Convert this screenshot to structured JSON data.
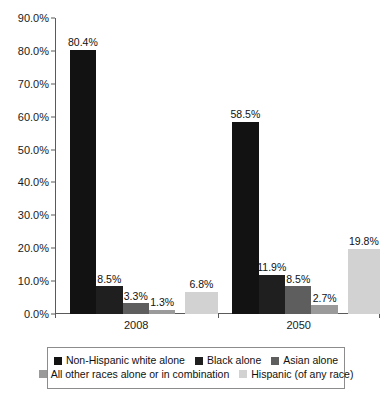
{
  "chart_data": {
    "type": "bar",
    "title": "",
    "subtitle": "",
    "xlabel": "",
    "ylabel": "",
    "grid": false,
    "legend_position": "bottom",
    "ylim": [
      0,
      90
    ],
    "ytick_labels": [
      "90.0%",
      "80.0%",
      "70.0%",
      "60.0%",
      "50.0%",
      "40.0%",
      "30.0%",
      "20.0%",
      "10.0%",
      "0.0%"
    ],
    "ytick_values": [
      90,
      80,
      70,
      60,
      50,
      40,
      30,
      20,
      10,
      0
    ],
    "categories": [
      "2008",
      "2050"
    ],
    "series": [
      {
        "name": "Non-Hispanic white alone",
        "color": "#121212",
        "values": [
          80.4,
          58.5
        ],
        "labels": [
          "80.4%",
          "58.5%"
        ]
      },
      {
        "name": "Black alone",
        "color": "#1f1f1f",
        "values": [
          8.5,
          11.9
        ],
        "labels": [
          "8.5%",
          "11.9%"
        ]
      },
      {
        "name": "Asian alone",
        "color": "#5e5e5e",
        "values": [
          3.3,
          8.5
        ],
        "labels": [
          "3.3%",
          "8.5%"
        ]
      },
      {
        "name": "All other races alone or in combination",
        "color": "#9a9a9a",
        "values": [
          1.3,
          2.7
        ],
        "labels": [
          "1.3%",
          "2.7%"
        ]
      },
      {
        "name": "Hispanic (of any race)",
        "color": "#d2d2d2",
        "values": [
          6.8,
          19.8
        ],
        "labels": [
          "6.8%",
          "19.8%"
        ]
      }
    ]
  },
  "legend": {
    "rows": [
      [
        {
          "label": "Non-Hispanic white alone",
          "color": "#121212"
        },
        {
          "label": "Black alone",
          "color": "#1f1f1f"
        },
        {
          "label": "Asian alone",
          "color": "#5e5e5e"
        }
      ],
      [
        {
          "label": "All other races alone or in combination",
          "color": "#9a9a9a"
        },
        {
          "label": "Hispanic (of any race)",
          "color": "#d2d2d2"
        }
      ]
    ]
  }
}
